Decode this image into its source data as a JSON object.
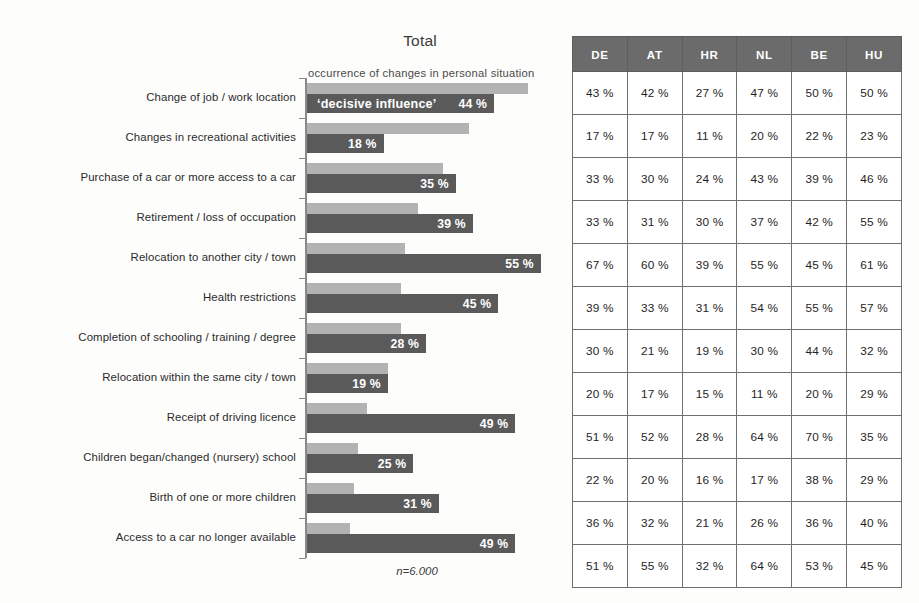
{
  "chart": {
    "title": "Total",
    "legend_occurrence": "occurrence of changes in personal situation",
    "legend_decisive": "‘decisive influence’",
    "footnote": "n=6.000"
  },
  "table": {
    "columns": [
      "DE",
      "AT",
      "HR",
      "NL",
      "BE",
      "HU"
    ]
  },
  "chart_data": {
    "type": "bar",
    "title": "Total",
    "xlabel": "",
    "ylabel": "",
    "xlim": [
      0,
      60
    ],
    "grid": false,
    "legend_position": "top",
    "orientation": "horizontal",
    "categories": [
      "Change of job / work location",
      "Changes in recreational activities",
      "Purchase of a car or more access to a car",
      "Retirement / loss of occupation",
      "Relocation to another city / town",
      "Health restrictions",
      "Completion of schooling / training / degree",
      "Relocation within the same city / town",
      "Receipt of driving licence",
      "Children began/changed (nursery) school",
      "Birth of one or more children",
      "Access to a car no longer available"
    ],
    "series": [
      {
        "name": "occurrence of changes in personal situation",
        "color": "#b3b3b3",
        "labelled": false,
        "values": [
          52,
          38,
          32,
          26,
          23,
          22,
          22,
          19,
          14,
          12,
          11,
          10
        ]
      },
      {
        "name": "‘decisive influence’",
        "color": "#5a5a5a",
        "labelled": true,
        "values": [
          44,
          18,
          35,
          39,
          55,
          45,
          28,
          19,
          49,
          25,
          31,
          49
        ],
        "value_labels": [
          "44 %",
          "18 %",
          "35 %",
          "39 %",
          "55 %",
          "45 %",
          "28 %",
          "19 %",
          "49 %",
          "25 %",
          "31 %",
          "49 %"
        ]
      }
    ],
    "table": {
      "columns": [
        "DE",
        "AT",
        "HR",
        "NL",
        "BE",
        "HU"
      ],
      "rows": [
        [
          "43 %",
          "42 %",
          "27 %",
          "47 %",
          "50 %",
          "50 %"
        ],
        [
          "17 %",
          "17 %",
          "11 %",
          "20 %",
          "22 %",
          "23 %"
        ],
        [
          "33 %",
          "30 %",
          "24 %",
          "43 %",
          "39 %",
          "46 %"
        ],
        [
          "33 %",
          "31 %",
          "30 %",
          "37 %",
          "42 %",
          "55 %"
        ],
        [
          "67 %",
          "60 %",
          "39 %",
          "55 %",
          "45 %",
          "61 %"
        ],
        [
          "39 %",
          "33 %",
          "31 %",
          "54 %",
          "55 %",
          "57 %"
        ],
        [
          "30 %",
          "21 %",
          "19 %",
          "30 %",
          "44 %",
          "32 %"
        ],
        [
          "20 %",
          "17 %",
          "15 %",
          "11 %",
          "20 %",
          "29 %"
        ],
        [
          "51 %",
          "52 %",
          "28 %",
          "64 %",
          "70 %",
          "35 %"
        ],
        [
          "22 %",
          "20 %",
          "16 %",
          "17 %",
          "38 %",
          "29 %"
        ],
        [
          "36 %",
          "32 %",
          "21 %",
          "26 %",
          "36 %",
          "40 %"
        ],
        [
          "51 %",
          "55 %",
          "32 %",
          "64 %",
          "53 %",
          "45 %"
        ]
      ]
    },
    "footnote": "n=6.000"
  }
}
